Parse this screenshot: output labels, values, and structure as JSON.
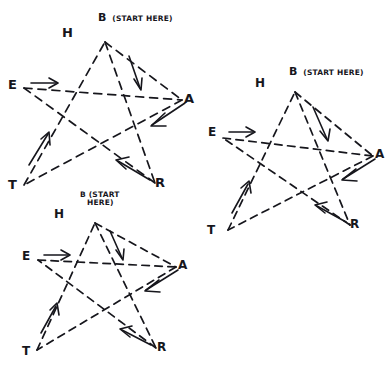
{
  "page": {
    "background_color": "#ffffff",
    "ink_color": "#16161c",
    "style": "hand-drawn pencil sketch, dashed strokes",
    "figure_count": 3
  },
  "figures": [
    {
      "id": "star-top-left",
      "name": "five-pointed-star-top-left",
      "start_note": "B (START HERE)",
      "start_note_line1": "B",
      "start_note_line2": "(START HERE)",
      "note_layout": "inline",
      "vertices": [
        {
          "key": "apex",
          "label": "H"
        },
        {
          "key": "left",
          "label": "E"
        },
        {
          "key": "right",
          "label": "A"
        },
        {
          "key": "bottom_left",
          "label": "T"
        },
        {
          "key": "bottom_right",
          "label": "R"
        }
      ],
      "path_order": [
        "B",
        "A",
        "T",
        "H",
        "R",
        "E"
      ],
      "arrows": [
        {
          "from": "B",
          "to": "A",
          "direction": "down-right"
        },
        {
          "from": "A",
          "to": "T",
          "direction": "down-left"
        },
        {
          "from": "T",
          "to": "H",
          "direction": "up-right"
        },
        {
          "from": "R",
          "to": "T",
          "direction": "up-left"
        },
        {
          "from": "E",
          "to": "A",
          "direction": "right"
        }
      ]
    },
    {
      "id": "star-bottom-left",
      "name": "five-pointed-star-bottom-left",
      "start_note": "B (START HERE)",
      "start_note_line1": "B (START",
      "start_note_line2": "HERE)",
      "note_layout": "stacked",
      "vertices": [
        {
          "key": "apex",
          "label": "H"
        },
        {
          "key": "left",
          "label": "E"
        },
        {
          "key": "right",
          "label": "A"
        },
        {
          "key": "bottom_left",
          "label": "T"
        },
        {
          "key": "bottom_right",
          "label": "R"
        }
      ],
      "path_order": [
        "B",
        "A",
        "T",
        "H",
        "R",
        "E"
      ],
      "arrows": [
        {
          "from": "B",
          "to": "A",
          "direction": "down-right"
        },
        {
          "from": "A",
          "to": "T",
          "direction": "down-left"
        },
        {
          "from": "T",
          "to": "H",
          "direction": "up-right"
        },
        {
          "from": "R",
          "to": "T",
          "direction": "up-left"
        },
        {
          "from": "E",
          "to": "A",
          "direction": "right"
        }
      ]
    },
    {
      "id": "star-right",
      "name": "five-pointed-star-right",
      "start_note": "B (START HERE)",
      "start_note_line1": "B",
      "start_note_line2": "(START HERE)",
      "note_layout": "inline",
      "vertices": [
        {
          "key": "apex",
          "label": "H"
        },
        {
          "key": "left",
          "label": "E"
        },
        {
          "key": "right",
          "label": "A"
        },
        {
          "key": "bottom_left",
          "label": "T"
        },
        {
          "key": "bottom_right",
          "label": "R"
        }
      ],
      "path_order": [
        "B",
        "A",
        "T",
        "H",
        "R",
        "E"
      ],
      "arrows": [
        {
          "from": "B",
          "to": "A",
          "direction": "down-right"
        },
        {
          "from": "A",
          "to": "T",
          "direction": "down-left"
        },
        {
          "from": "T",
          "to": "H",
          "direction": "up-right"
        },
        {
          "from": "R",
          "to": "T",
          "direction": "up-left"
        },
        {
          "from": "E",
          "to": "A",
          "direction": "right"
        }
      ]
    }
  ]
}
